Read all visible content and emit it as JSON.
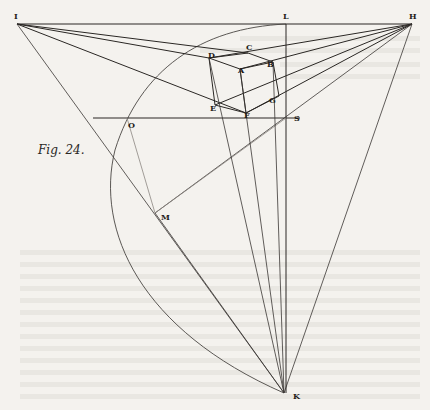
{
  "figure": {
    "caption": "Fig. 24.",
    "points": {
      "I": {
        "label": "I",
        "x": 17,
        "y": 24
      },
      "L": {
        "label": "L",
        "x": 286,
        "y": 24
      },
      "H": {
        "label": "H",
        "x": 412,
        "y": 24
      },
      "C": {
        "label": "C",
        "x": 248,
        "y": 53
      },
      "D": {
        "label": "D",
        "x": 209,
        "y": 58
      },
      "B": {
        "label": "B",
        "x": 273,
        "y": 62
      },
      "A": {
        "label": "A",
        "x": 240,
        "y": 69
      },
      "E": {
        "label": "E",
        "x": 215,
        "y": 105
      },
      "F": {
        "label": "F",
        "x": 246,
        "y": 113
      },
      "G": {
        "label": "G",
        "x": 279,
        "y": 96
      },
      "O": {
        "label": "O",
        "x": 127,
        "y": 118
      },
      "S": {
        "label": "S",
        "x": 286,
        "y": 118
      },
      "M": {
        "label": "M",
        "x": 155,
        "y": 213
      },
      "K": {
        "label": "K",
        "x": 284,
        "y": 393
      }
    },
    "colors": {
      "paper": "#f4f2ee",
      "ink": "#2a2724"
    }
  }
}
